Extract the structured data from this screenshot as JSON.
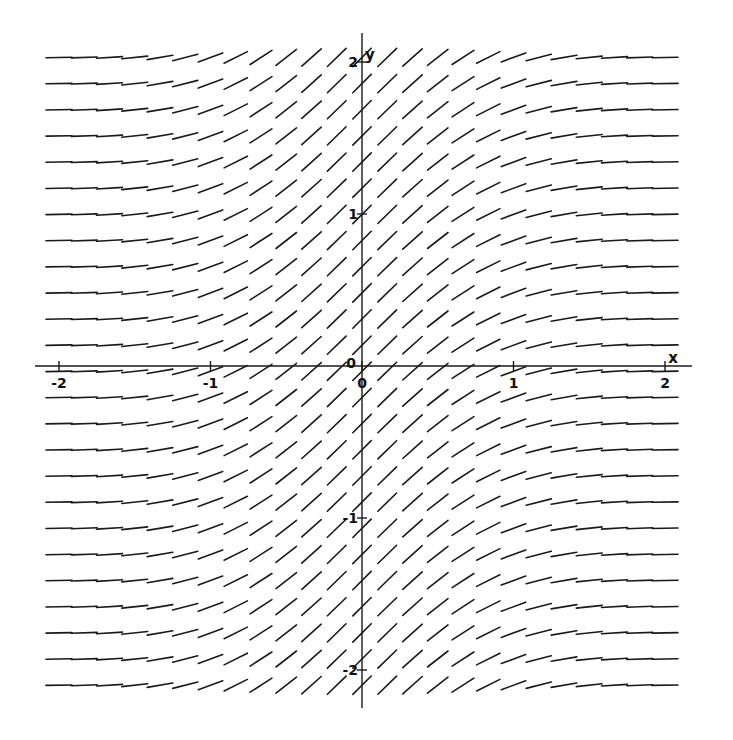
{
  "chart_data": {
    "type": "slope_field",
    "title": "",
    "equation": "dy/dx = e^(-x^2)",
    "xlabel": "x",
    "ylabel": "y",
    "xlim": [
      -2,
      2
    ],
    "ylim": [
      -2,
      2
    ],
    "grid": false,
    "x_ticks": [
      {
        "value": -2,
        "label": "-2"
      },
      {
        "value": -1,
        "label": "-1"
      },
      {
        "value": 0,
        "label": "0"
      },
      {
        "value": 1,
        "label": "1"
      },
      {
        "value": 2,
        "label": "2"
      }
    ],
    "y_ticks": [
      {
        "value": 2,
        "label": "2"
      },
      {
        "value": 1,
        "label": "1"
      },
      {
        "value": 0,
        "label": "0"
      },
      {
        "value": -1,
        "label": "-1"
      },
      {
        "value": -2,
        "label": "-2"
      }
    ],
    "segment_grid": {
      "x_start": -2,
      "x_end": 2,
      "x_count": 25,
      "y_start": 2.03,
      "y_end": -2.1,
      "y_count": 25
    },
    "slope_samples": [
      {
        "x": -2,
        "slope": 0.018
      },
      {
        "x": -1.5,
        "slope": 0.105
      },
      {
        "x": -1,
        "slope": 0.368
      },
      {
        "x": -0.5,
        "slope": 0.779
      },
      {
        "x": 0,
        "slope": 1.0
      },
      {
        "x": 0.5,
        "slope": 0.779
      },
      {
        "x": 1,
        "slope": 0.368
      },
      {
        "x": 1.5,
        "slope": 0.105
      },
      {
        "x": 2,
        "slope": 0.018
      }
    ]
  },
  "layout": {
    "origin_px": [
      362,
      366
    ],
    "px_per_unit_x": 151.5,
    "px_per_unit_y": 152,
    "x_axis_px": [
      35,
      692
    ],
    "y_axis_px": [
      33,
      708
    ],
    "segment_length_px": 26,
    "line_color": "#1a1a1a"
  }
}
